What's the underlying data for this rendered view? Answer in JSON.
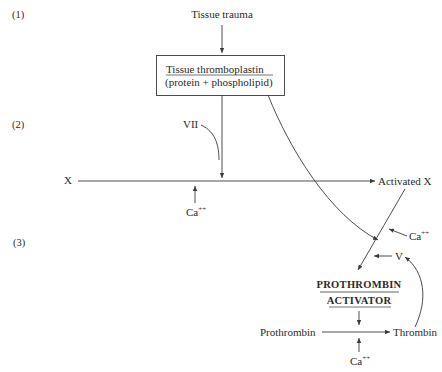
{
  "diagram": {
    "stages": [
      {
        "label": "(1)"
      },
      {
        "label": "(2)"
      },
      {
        "label": "(3)"
      }
    ],
    "nodes": {
      "tissue_trauma": "Tissue trauma",
      "thromboplastin_title": "Tissue thromboplastin",
      "thromboplastin_sub": "(protein + phospholipid)",
      "factor_vii": "VII",
      "factor_x": "X",
      "activated_x": "Activated X",
      "calcium_1": "Ca",
      "calcium_1_sup": "++",
      "calcium_2": "Ca",
      "calcium_2_sup": "++",
      "calcium_3": "Ca",
      "calcium_3_sup": "++",
      "factor_v": "V",
      "prothrombin_activator_1": "PROTHROMBIN",
      "prothrombin_activator_2": "ACTIVATOR",
      "prothrombin": "Prothrombin",
      "thrombin": "Thrombin"
    },
    "colors": {
      "line": "#3a3a3a",
      "text": "#2a2a2a",
      "background": "#ffffff"
    }
  }
}
